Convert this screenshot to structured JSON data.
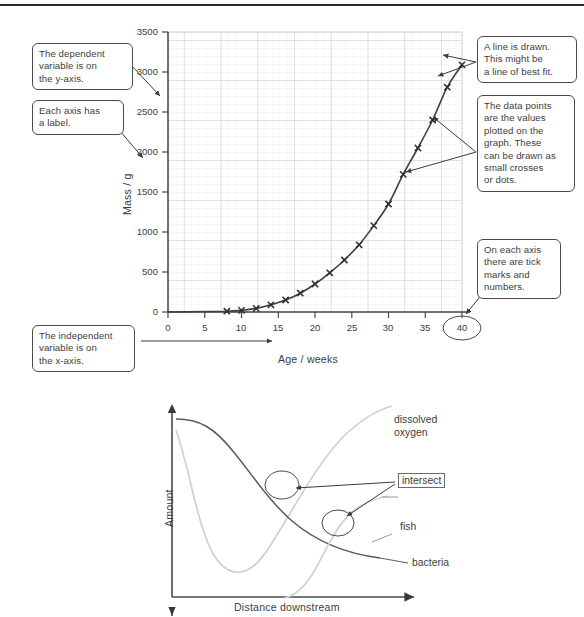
{
  "page": {
    "divider": "horizontal-rule"
  },
  "annotations": [
    {
      "id": "dependent-variable",
      "lines": [
        "The dependent",
        "variable is on",
        "the y-axis."
      ]
    },
    {
      "id": "axis-label",
      "lines": [
        "Each axis has",
        "a label."
      ]
    },
    {
      "id": "independent-variable",
      "lines": [
        "The independent",
        "variable is on",
        "the x-axis."
      ]
    },
    {
      "id": "line-of-best-fit",
      "lines": [
        "A line is drawn.",
        "This might be",
        "a line of best fit."
      ]
    },
    {
      "id": "data-points",
      "lines": [
        "The data points",
        "are the values",
        "plotted on the",
        "graph. These",
        "can be drawn as",
        "small crosses",
        "or dots."
      ]
    },
    {
      "id": "tick-marks",
      "lines": [
        "On each axis",
        "there are tick",
        "marks and",
        "numbers."
      ]
    }
  ],
  "chart_data": [
    {
      "type": "line",
      "id": "growth-curve",
      "title": "",
      "xlabel": "Age / weeks",
      "ylabel": "Mass / g",
      "xlim": [
        0,
        41
      ],
      "ylim": [
        0,
        3500
      ],
      "xticks": [
        0,
        5,
        10,
        15,
        20,
        25,
        30,
        35,
        40
      ],
      "yticks": [
        0,
        500,
        1000,
        1500,
        2000,
        2500,
        3000,
        3500
      ],
      "grid": true,
      "grid_major_x": 5,
      "grid_major_y": 500,
      "grid_minor_x": 1,
      "grid_minor_y": 100,
      "marker": "cross",
      "legend": "none",
      "highlight_tick": "40",
      "x": [
        8,
        10,
        12,
        14,
        16,
        18,
        20,
        22,
        24,
        26,
        28,
        30,
        32,
        34,
        36,
        38,
        40
      ],
      "y": [
        10,
        20,
        45,
        90,
        150,
        235,
        350,
        490,
        650,
        840,
        1080,
        1350,
        1720,
        2050,
        2400,
        2810,
        3090
      ]
    },
    {
      "type": "line",
      "id": "river-pollution-curves",
      "title": "",
      "xlabel": "Distance downstream",
      "ylabel": "Amount",
      "xticks": [],
      "yticks": [],
      "grid": false,
      "series": [
        {
          "name": "dissolved oxygen",
          "label": "dissolved\noxygen",
          "color": "#cfcfcf",
          "shape": "dip-then-rise"
        },
        {
          "name": "bacteria",
          "label": "bacteria",
          "color": "#5a5a5a",
          "shape": "high-then-decay"
        },
        {
          "name": "fish",
          "label": "fish",
          "color": "#cfcfcf",
          "shape": "late-rise"
        }
      ],
      "annotations": [
        {
          "name": "intersect",
          "label": "intersect",
          "targets": 2
        }
      ]
    }
  ],
  "labels": {
    "chart1": {
      "ylabel": "Mass / g",
      "xlabel": "Age / weeks",
      "yticks": [
        "0",
        "500",
        "1000",
        "1500",
        "2000",
        "2500",
        "3000",
        "3500"
      ],
      "xticks": [
        "0",
        "5",
        "10",
        "15",
        "20",
        "25",
        "30",
        "35",
        "40"
      ]
    },
    "chart2": {
      "ylabel": "Amount",
      "xlabel": "Distance downstream",
      "dissolved_oxygen_1": "dissolved",
      "dissolved_oxygen_2": "oxygen",
      "fish": "fish",
      "bacteria": "bacteria",
      "intersect": "intersect"
    }
  },
  "colors": {
    "ink": "#3a3a3a",
    "curve_dark": "#3f3f3f",
    "curve_light": "#d0d0d0",
    "grid_major": "#b9c3d0",
    "grid_minor": "#dfe6ee",
    "box_border": "#4a4a4a",
    "axis": "#4a4a4a"
  }
}
